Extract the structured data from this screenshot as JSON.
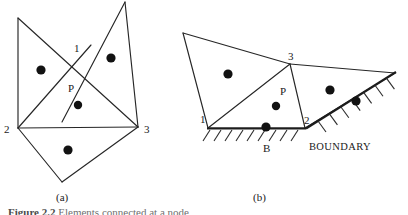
{
  "figure": {
    "caption_prefix": "Figure 2.2",
    "caption_text": "Elements connected at a node",
    "panels": [
      {
        "id": "a",
        "label": "(a)",
        "label_x": 56,
        "label_y": 201,
        "vertex_labels": [
          {
            "text": "1",
            "x": 74,
            "y": 52
          },
          {
            "text": "2",
            "x": 4,
            "y": 133
          },
          {
            "text": "3",
            "x": 144,
            "y": 133
          }
        ],
        "point_labels": [
          {
            "text": "P",
            "x": 68,
            "y": 92
          }
        ],
        "polylines": [
          "18,18 18,128",
          "18,18 138,127",
          "125,2 62,122",
          "125,2 138,127",
          "18,128 138,127",
          "18,128 91,45",
          "18,128 62,182",
          "62,182 138,127"
        ],
        "dots": [
          {
            "cx": 41,
            "cy": 70,
            "r": 4.6
          },
          {
            "cx": 111,
            "cy": 58,
            "r": 4.6
          },
          {
            "cx": 78,
            "cy": 105,
            "r": 4.2
          },
          {
            "cx": 68,
            "cy": 150,
            "r": 4.6
          }
        ]
      },
      {
        "id": "b",
        "label": "(b)",
        "label_x": 253,
        "label_y": 201,
        "vertex_labels": [
          {
            "text": "3",
            "x": 288,
            "y": 60
          },
          {
            "text": "1",
            "x": 200,
            "y": 123
          },
          {
            "text": "2",
            "x": 304,
            "y": 124
          }
        ],
        "point_labels": [
          {
            "text": "P",
            "x": 280,
            "y": 95
          },
          {
            "text": "B",
            "x": 263,
            "y": 152
          }
        ],
        "boundary_label": {
          "text": "BOUNDARY",
          "x": 340,
          "y": 150
        },
        "polylines": [
          "183,33 290,64",
          "183,33 208,128",
          "208,128 290,64",
          "290,64 305,128",
          "208,128 305,128",
          "290,64 395,73",
          "305,128 395,73"
        ],
        "boundary_segments": [
          {
            "x1": 207,
            "y1": 128.5,
            "x2": 306,
            "y2": 128.5
          },
          {
            "x1": 306,
            "y1": 128.5,
            "x2": 396,
            "y2": 72.0
          }
        ],
        "hatch_horizontal": {
          "count": 9,
          "x_start": 210,
          "x_step": 11.0,
          "y_top": 130,
          "dx": -7,
          "dy": 11
        },
        "hatch_inclined": {
          "count": 7,
          "x_start": 318,
          "x_step": 11.4,
          "slope": -0.627,
          "y_ref": 121.0,
          "dx": 8,
          "dy": 11
        },
        "dots": [
          {
            "cx": 228,
            "cy": 74,
            "r": 4.6
          },
          {
            "cx": 276,
            "cy": 106,
            "r": 4.2
          },
          {
            "cx": 330,
            "cy": 90,
            "r": 4.6
          },
          {
            "cx": 356,
            "cy": 101,
            "r": 4.6
          },
          {
            "cx": 266,
            "cy": 127,
            "r": 4.6
          }
        ]
      }
    ]
  }
}
